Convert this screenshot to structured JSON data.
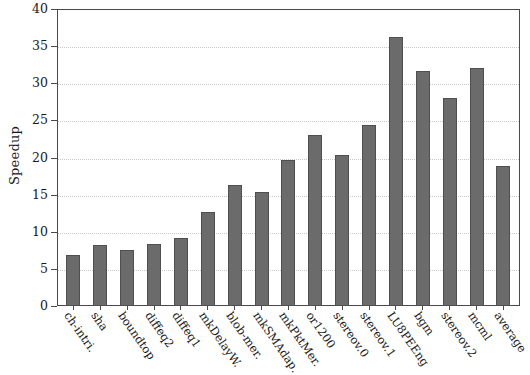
{
  "chart_data": {
    "type": "bar",
    "title": "",
    "xlabel": "",
    "ylabel": "Speedup",
    "ylim": [
      0,
      40
    ],
    "yticks": [
      0,
      5,
      10,
      15,
      20,
      25,
      30,
      35,
      40
    ],
    "grid": true,
    "legend": "none",
    "bar_color": "#6b6b6b",
    "categories": [
      "ch-intri.",
      "sha",
      "boundtop",
      "diffeq2",
      "diffeq1",
      "mkDelayW.",
      "blob-mer.",
      "mkSMAdap.",
      "mkPktMer.",
      "or1200",
      "stereov.0",
      "stereov.1",
      "LU8PEEng",
      "bgm",
      "stereov.2",
      "mcml",
      "average"
    ],
    "values": [
      6.9,
      8.2,
      7.6,
      8.4,
      9.2,
      12.6,
      16.3,
      15.4,
      19.6,
      23.0,
      20.3,
      24.4,
      36.2,
      31.6,
      28.0,
      32.1,
      18.9
    ]
  }
}
